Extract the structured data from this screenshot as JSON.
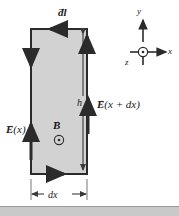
{
  "figure": {
    "background_color": "#ffffff",
    "loop_fill_color": "#d2d2d2",
    "line_color": "#2b2b2b",
    "band_color": "#c9c9c9"
  },
  "labels": {
    "line_element": {
      "symbol": "d",
      "variable": "l",
      "vector": true,
      "text": "dl"
    },
    "height": {
      "text": "h"
    },
    "field_right": {
      "prefix": "E",
      "arg": "(x + dx)",
      "vector": true
    },
    "field_left": {
      "prefix": "E",
      "arg": "(x)",
      "vector": true
    },
    "magnetic_field": {
      "prefix": "B",
      "vector": true,
      "direction": "out-of-page"
    },
    "width": {
      "text": "dx"
    }
  },
  "axes": {
    "y_label": "y",
    "x_label": "x",
    "z_label": "z",
    "z_direction": "out-of-page"
  },
  "arrows": {
    "top_edge_direction": "left",
    "left_edge_direction": "down",
    "right_edge_direction": "up",
    "bottom_edge_direction": "right",
    "circulation": "counterclockwise",
    "field_left_direction": "up",
    "field_right_direction": "up"
  },
  "glyphs": {
    "vector_arrow": "→",
    "dot_out_of_page": "⊙"
  }
}
